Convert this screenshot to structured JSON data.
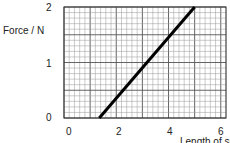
{
  "chart_data": {
    "type": "line",
    "title": "",
    "xlabel": "Length of spring",
    "ylabel": "Force / N",
    "xlim": [
      0,
      6.2
    ],
    "ylim": [
      0,
      2
    ],
    "x_ticks": [
      "0",
      "2",
      "4",
      "6"
    ],
    "y_ticks": [
      "0",
      "1",
      "2"
    ],
    "grid": true,
    "series": [
      {
        "name": "force-extension",
        "x": [
          1.35,
          5.0
        ],
        "y": [
          0,
          2.0
        ],
        "color": "#000000"
      }
    ]
  },
  "labels": {
    "y_axis": "Force / N",
    "x_axis": "Length of sp",
    "y_tick_2": "2",
    "y_tick_1": "1",
    "y_tick_0": "0",
    "x_tick_0": "0",
    "x_tick_2": "2",
    "x_tick_4": "4",
    "x_tick_6": "6"
  }
}
